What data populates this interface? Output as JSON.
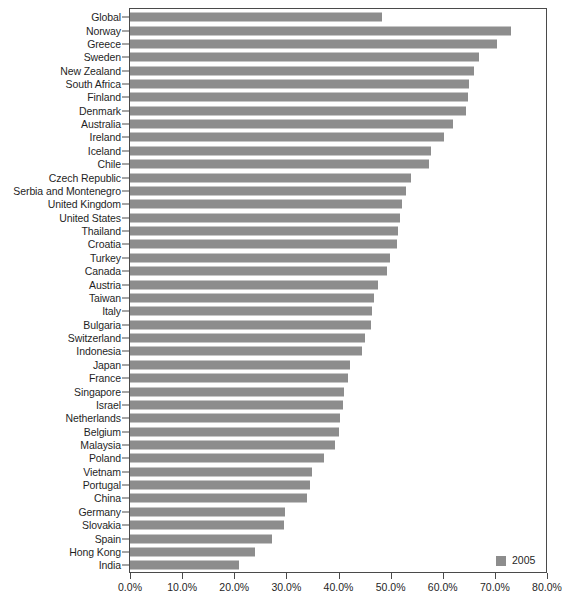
{
  "chart_data": {
    "type": "bar",
    "orientation": "horizontal",
    "title": "",
    "subtitle": "",
    "xlabel": "",
    "ylabel": "",
    "xlim": [
      0,
      80
    ],
    "xtick_labels": [
      "0.0%",
      "10.0%",
      "20.0%",
      "30.0%",
      "40.0%",
      "50.0%",
      "60.0%",
      "70.0%",
      "80.0%"
    ],
    "xtick_values": [
      0,
      10,
      20,
      30,
      40,
      50,
      60,
      70,
      80
    ],
    "grid": false,
    "legend": {
      "position": "bottom-right",
      "entries": [
        {
          "label": "2005",
          "color": "#8d8d8d"
        }
      ]
    },
    "series": [
      {
        "name": "2005",
        "color": "#8d8d8d",
        "values": [
          48.3,
          73.0,
          70.5,
          67.0,
          66.0,
          65.0,
          64.8,
          64.5,
          62.0,
          60.3,
          57.8,
          57.3,
          54.0,
          53.0,
          52.2,
          51.8,
          51.5,
          51.2,
          49.8,
          49.3,
          47.5,
          46.8,
          46.5,
          46.3,
          45.0,
          44.5,
          42.3,
          41.8,
          41.0,
          40.8,
          40.3,
          40.0,
          39.3,
          37.3,
          35.0,
          34.5,
          34.0,
          29.8,
          29.5,
          27.3,
          24.0,
          21.0
        ]
      }
    ],
    "categories": [
      "Global",
      "Norway",
      "Greece",
      "Sweden",
      "New Zealand",
      "South Africa",
      "Finland",
      "Denmark",
      "Australia",
      "Ireland",
      "Iceland",
      "Chile",
      "Czech Republic",
      "Serbia and Montenegro",
      "United Kingdom",
      "United States",
      "Thailand",
      "Croatia",
      "Turkey",
      "Canada",
      "Austria",
      "Taiwan",
      "Italy",
      "Bulgaria",
      "Switzerland",
      "Indonesia",
      "Japan",
      "France",
      "Singapore",
      "Israel",
      "Netherlands",
      "Belgium",
      "Malaysia",
      "Poland",
      "Vietnam",
      "Portugal",
      "China",
      "Germany",
      "Slovakia",
      "Spain",
      "Hong Kong",
      "India"
    ]
  },
  "colors": {
    "bar": "#8d8d8d",
    "axis": "#4a4a4a",
    "text": "#1f1f1f",
    "background": "#ffffff"
  }
}
